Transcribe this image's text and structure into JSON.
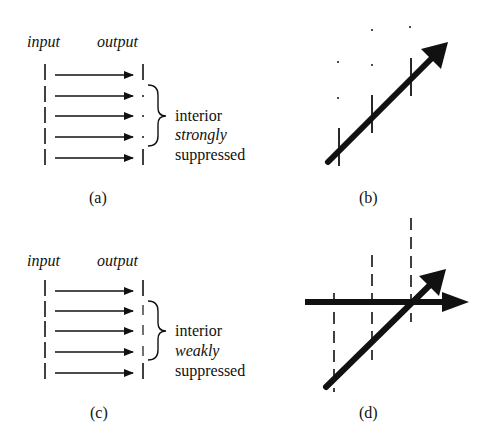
{
  "panels": {
    "a": {
      "caption": "(a)",
      "input_label": "input",
      "output_label": "output",
      "rows": 5,
      "interior_output": "dots",
      "note": [
        "interior",
        "strongly",
        "suppressed"
      ]
    },
    "b": {
      "caption": "(b)"
    },
    "c": {
      "caption": "(c)",
      "input_label": "input",
      "output_label": "output",
      "rows": 5,
      "interior_output": "short-bars",
      "note": [
        "interior",
        "weakly",
        "suppressed"
      ]
    },
    "d": {
      "caption": "(d)"
    }
  }
}
